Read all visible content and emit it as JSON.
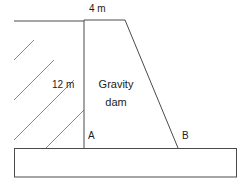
{
  "figure": {
    "kind": "engineering-cross-section",
    "canvas": {
      "width": 247,
      "height": 186
    },
    "background_color": "#ffffff",
    "line_color": "#4a4a4a",
    "hatch_color": "#8a8a8a",
    "text_color": "#1c1c1c"
  },
  "labels": {
    "crest_width": "4 m",
    "dam_height": "12 m",
    "body_line_1": "Gravity",
    "body_line_2": "dam",
    "point_a": "A",
    "point_b": "B"
  },
  "geometry": {
    "ground_line": {
      "x1": 14,
      "y1": 21,
      "x2": 84,
      "y2": 21
    },
    "dam_crest": {
      "x1": 84,
      "y1": 20,
      "x2": 125,
      "y2": 20
    },
    "upstream_face": {
      "x1": 84,
      "y1": 20,
      "x2": 84,
      "y2": 148
    },
    "downstream_face": {
      "x1": 125,
      "y1": 20,
      "x2": 178,
      "y2": 148
    },
    "foundation": {
      "x": 14,
      "y": 148,
      "width": 223,
      "height": 29
    },
    "hatch_angle_deg": 45,
    "hatch_line_count": 7
  }
}
